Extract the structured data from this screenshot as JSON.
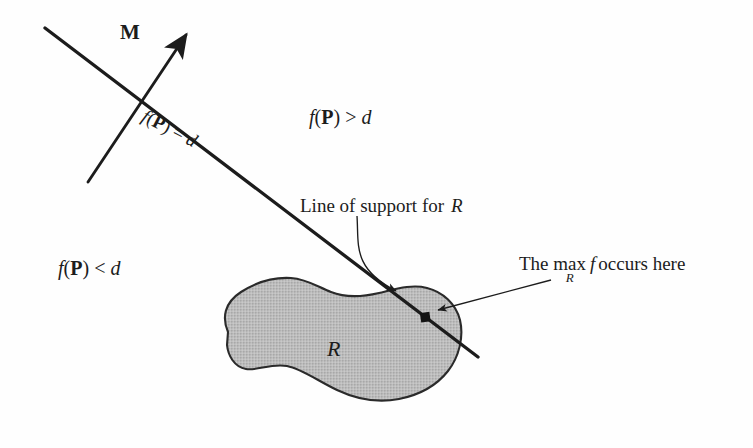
{
  "figure": {
    "background_color": "#fefefe",
    "ink_color": "#1c1c1c",
    "region_fill_color": "#b8b8b8",
    "region_stroke_color": "#2a2a2a",
    "labels": {
      "vector_m": "M",
      "f_greater": {
        "f": "f",
        "open": "(",
        "p": "P",
        "close": ")",
        "relation": ">",
        "d": "d"
      },
      "f_less": {
        "f": "f",
        "open": "(",
        "p": "P",
        "close": ")",
        "relation": "<",
        "d": "d"
      },
      "f_equal": {
        "f": "f",
        "open": "(",
        "p": "P",
        "close": ")",
        "relation": "=",
        "d": "d"
      },
      "line_of_support": {
        "text": "Line of support for",
        "region": "R"
      },
      "max_callout": {
        "the": "The",
        "max": "max",
        "sub": "R",
        "f": "f",
        "tail": "occurs here"
      },
      "region_name": "R"
    },
    "geometry": {
      "support_line": {
        "x1": 45,
        "y1": 28,
        "x2": 478,
        "y2": 357,
        "stroke_width": 3.2
      },
      "normal_vector_m": {
        "x1": 88,
        "y1": 182,
        "x2": 192,
        "y2": 27,
        "stroke_width": 3.0,
        "arrow": "filled-head"
      },
      "tangent_point": {
        "x": 425,
        "y": 317,
        "size": 9,
        "shape": "square-dot"
      },
      "leader_line_of_support": {
        "from_x": 357,
        "from_y": 216,
        "to_x": 398,
        "to_y": 297,
        "stroke_width": 1.3
      },
      "leader_max_callout": {
        "from_x": 551,
        "from_y": 280,
        "to_x": 433,
        "to_y": 311,
        "stroke_width": 1.3
      },
      "region_bounds": {
        "left": 218,
        "top": 277,
        "right": 462,
        "bottom": 401
      }
    }
  }
}
